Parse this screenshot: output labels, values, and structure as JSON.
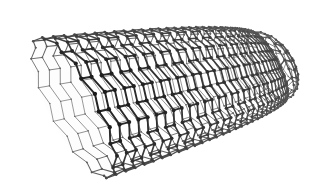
{
  "figure": {
    "style": "grayscale-ball-and-stick-perspective",
    "width": 311,
    "height": 196,
    "background_color": "#ffffff",
    "caption": "",
    "labels": [],
    "annotations": []
  },
  "palette": {
    "background": "#ffffff",
    "bond_near": "#3a3a3a",
    "bond_far": "#6e6e6e",
    "atom_near": "#262626",
    "atom_far": "#5e5e5e",
    "interior": "#fdfdfd"
  },
  "geometry": {
    "type": "cylindrical-hexagonal-lattice",
    "chirality": "armchair",
    "circumference_units": 26,
    "length_units": 30,
    "axis_start": {
      "x": 72,
      "y": 108
    },
    "axis_end": {
      "x": 268,
      "y": 66
    },
    "radius_near": 78,
    "radius_far": 38,
    "cap_far": true,
    "open_end_near": true,
    "rim_tilt_deg": -14,
    "perspective_strength": 0.62,
    "bond_width_near": 2.0,
    "bond_width_far": 0.75,
    "atom_radius_near": 2.2,
    "atom_radius_far": 0.7
  },
  "bounds": {
    "left": 18,
    "right": 297,
    "top": 22,
    "bottom": 186
  }
}
